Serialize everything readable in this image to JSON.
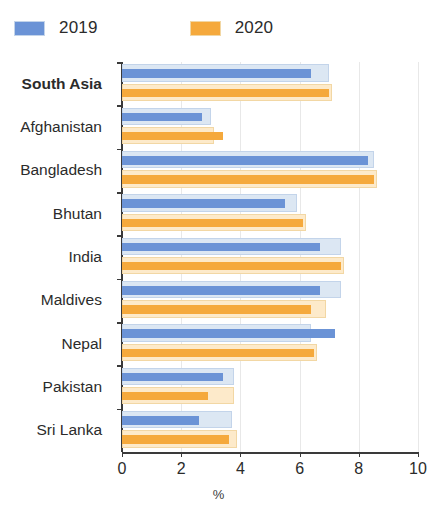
{
  "legend": {
    "entries": [
      {
        "label": "2019",
        "color": "#6b93d6"
      },
      {
        "label": "2020",
        "color": "#f5a93c"
      }
    ]
  },
  "axis": {
    "x_ticks": [
      "0",
      "2",
      "4",
      "6",
      "8",
      "10"
    ],
    "x_title": "%"
  },
  "colors": {
    "series_2019_fill": "#6b93d6",
    "series_2019_band": "#dce7f3",
    "series_2019_band_border": "#c3d4ea",
    "series_2020_fill": "#f5a93c",
    "series_2020_band": "#fdeaca",
    "series_2020_band_border": "#f2d7a4",
    "axis": "#3a3a3a",
    "grid": "#e8e8e8",
    "text": "#2b2b2b"
  },
  "chart_data": {
    "type": "bar",
    "orientation": "horizontal",
    "title": "",
    "subtitle": "",
    "xlabel": "%",
    "ylabel": "",
    "xlim": [
      0,
      10
    ],
    "xticks": [
      0,
      2,
      4,
      6,
      8,
      10
    ],
    "grid": true,
    "legend_position": "top-left",
    "categories": [
      "South Asia",
      "Afghanistan",
      "Bangladesh",
      "Bhutan",
      "India",
      "Maldives",
      "Nepal",
      "Pakistan",
      "Sri Lanka"
    ],
    "emphasized_categories": [
      "South Asia"
    ],
    "series": [
      {
        "name": "2019",
        "color": "#6b93d6",
        "values": [
          6.4,
          2.7,
          8.3,
          5.5,
          6.7,
          6.7,
          7.2,
          3.4,
          2.6
        ],
        "range_values": [
          7.0,
          3.0,
          8.5,
          5.9,
          7.4,
          7.4,
          6.4,
          3.8,
          3.7
        ]
      },
      {
        "name": "2020",
        "color": "#f5a93c",
        "values": [
          7.0,
          3.4,
          8.5,
          6.1,
          7.4,
          6.4,
          6.5,
          2.9,
          3.6
        ],
        "range_values": [
          7.1,
          3.1,
          8.6,
          6.2,
          7.5,
          6.9,
          6.6,
          3.8,
          3.9
        ]
      }
    ]
  }
}
